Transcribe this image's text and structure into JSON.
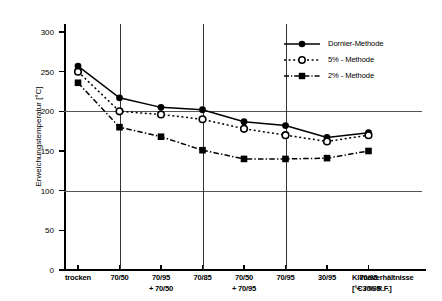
{
  "chart_data": {
    "type": "line",
    "title": "",
    "xlabel": "Klimaverhältnisse [°C / % R.F.]",
    "xlabel_line1": "Klimaverhältnisse",
    "xlabel_line2": "[°C / % R.F.]",
    "ylabel": "Erweichungstemperatur [°C]",
    "ylim": [
      0,
      310
    ],
    "yticks": [
      0,
      50,
      100,
      150,
      200,
      250,
      300
    ],
    "ytick_labels": [
      "0",
      "50",
      "100",
      "150",
      "200",
      "250",
      "300"
    ],
    "grid": "horizontal gridlines at 100 and 200; vertical gridlines at 70/50, 70/85 and 70/95",
    "hgridlines": [
      100,
      200
    ],
    "vgridlines": [
      "70/50",
      "70/85",
      "70/95"
    ],
    "legend_position": "top-right inside plot",
    "categories": [
      "trocken",
      "70/50",
      "70/95 + 70/50",
      "70/85",
      "70/50 + 70/95",
      "70/95",
      "30/95",
      "70/95 + 30/95"
    ],
    "category_lines": [
      {
        "line1": "trocken",
        "line2": ""
      },
      {
        "line1": "70/50",
        "line2": ""
      },
      {
        "line1": "70/95",
        "line2": "+ 70/50"
      },
      {
        "line1": "70/85",
        "line2": ""
      },
      {
        "line1": "70/50",
        "line2": "+ 70/95"
      },
      {
        "line1": "70/95",
        "line2": ""
      },
      {
        "line1": "30/95",
        "line2": ""
      },
      {
        "line1": "70/95",
        "line2": "+ 30/95"
      }
    ],
    "series": [
      {
        "name": "Dornier-Methode",
        "marker": "filled-circle",
        "linestyle": "solid",
        "color": "#000000",
        "values": [
          257,
          217,
          205,
          202,
          187,
          182,
          167,
          173
        ]
      },
      {
        "name": "5% - Methode",
        "marker": "open-circle",
        "linestyle": "dotted",
        "color": "#000000",
        "values": [
          250,
          200,
          196,
          190,
          178,
          170,
          162,
          170
        ]
      },
      {
        "name": "2% - Methode",
        "marker": "filled-square",
        "linestyle": "dash-dot",
        "color": "#000000",
        "values": [
          236,
          180,
          168,
          151,
          140,
          140,
          141,
          150
        ]
      }
    ]
  },
  "legend": {
    "items": [
      {
        "label": "Dornier-Methode"
      },
      {
        "label": "5% - Methode"
      },
      {
        "label": "2% - Methode"
      }
    ]
  }
}
